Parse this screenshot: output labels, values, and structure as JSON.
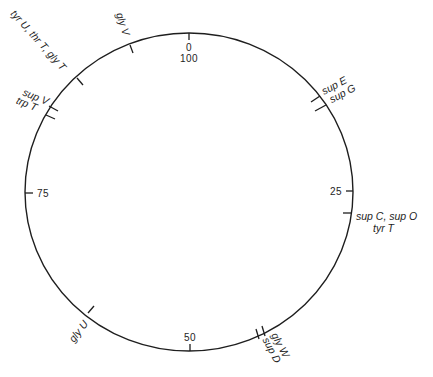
{
  "diagram": {
    "type": "circular-genetic-map",
    "center": [
      189,
      192
    ],
    "radius_x": 164,
    "radius_y": 159,
    "scale_units": "minutes",
    "scale_max": 100,
    "direction": "clockwise from top",
    "colors": {
      "line": "#1e1e1e",
      "text": "#1e1e1e",
      "background": "#ffffff"
    }
  },
  "scale_marks": [
    {
      "position": 0,
      "label_top": "0",
      "label_bottom": "100"
    },
    {
      "position": 25,
      "label": "25"
    },
    {
      "position": 50,
      "label": "50"
    },
    {
      "position": 75,
      "label": "75"
    }
  ],
  "loci": [
    {
      "id": "supE-supG",
      "positions": [
        15.0,
        16.2
      ],
      "lines": [
        "sup E",
        "sup G"
      ]
    },
    {
      "id": "supC-supO-tyrT",
      "positions": [
        27.2
      ],
      "lines": [
        "sup C, sup O",
        "tyr T"
      ]
    },
    {
      "id": "glyW-supD",
      "positions": [
        42.4,
        43.4
      ],
      "lines": [
        "gly W",
        "sup D"
      ]
    },
    {
      "id": "glyU",
      "positions": [
        61.0
      ],
      "lines": [
        "gly U"
      ]
    },
    {
      "id": "supV-trpT",
      "positions": [
        82.6,
        83.4
      ],
      "lines": [
        "sup V",
        "trp T"
      ]
    },
    {
      "id": "tyrU-thrT-glyT",
      "positions": [
        87.6
      ],
      "lines": [
        "tyr U, thr T, gly T"
      ]
    },
    {
      "id": "glyV",
      "positions": [
        93.9
      ],
      "lines": [
        "gly V"
      ]
    }
  ]
}
